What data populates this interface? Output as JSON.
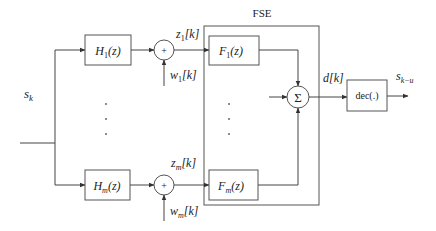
{
  "diagram": {
    "title": "FSE",
    "input": {
      "label": "s",
      "sub": "k"
    },
    "output": {
      "label": "s",
      "sub": "k−u"
    },
    "branches": [
      {
        "filter": {
          "name": "H",
          "sub": "1",
          "arg": "(z)"
        },
        "adder": "+",
        "noise": {
          "name": "w",
          "sub": "1",
          "idx": "[k]"
        },
        "signal": {
          "name": "z",
          "sub": "1",
          "idx": "[k]"
        },
        "equalizer": {
          "name": "F",
          "sub": "1",
          "arg": "(z)"
        }
      },
      {
        "filter": {
          "name": "H",
          "sub": "m",
          "arg": "(z)"
        },
        "adder": "+",
        "noise": {
          "name": "w",
          "sub": "m",
          "idx": "[k]"
        },
        "signal": {
          "name": "z",
          "sub": "m",
          "idx": "[k]"
        },
        "equalizer": {
          "name": "F",
          "sub": "m",
          "arg": "(z)"
        }
      }
    ],
    "summer": "Σ",
    "summer_output": {
      "name": "d",
      "idx": "[k]"
    },
    "decision": "dec(.)",
    "ellipsis": "⋮"
  }
}
